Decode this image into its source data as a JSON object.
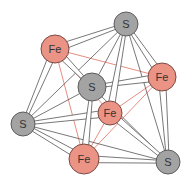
{
  "diagram": {
    "colors": {
      "fe_fill": "#eb9486",
      "fe_stroke": "#7a4a44",
      "s_fill": "#a3a3a3",
      "s_stroke": "#5c5c5c",
      "bond_stroke": "#555555",
      "bond_fill": "#ffffff",
      "fe_fe_line": "#e0705f",
      "s_s_line": "#555555",
      "label": "#333333"
    },
    "nodes": [
      {
        "id": "s1",
        "label": "S",
        "element": "S",
        "x": 126,
        "y": 24,
        "r": 12
      },
      {
        "id": "fe1",
        "label": "Fe",
        "element": "Fe",
        "x": 55,
        "y": 49,
        "r": 14
      },
      {
        "id": "s2",
        "label": "S",
        "element": "S",
        "x": 92,
        "y": 87,
        "r": 14
      },
      {
        "id": "fe2",
        "label": "Fe",
        "element": "Fe",
        "x": 162,
        "y": 77,
        "r": 14
      },
      {
        "id": "fe3",
        "label": "Fe",
        "element": "Fe",
        "x": 110,
        "y": 113,
        "r": 12
      },
      {
        "id": "s3",
        "label": "S",
        "element": "S",
        "x": 23,
        "y": 124,
        "r": 12
      },
      {
        "id": "fe4",
        "label": "Fe",
        "element": "Fe",
        "x": 84,
        "y": 159,
        "r": 15
      },
      {
        "id": "s4",
        "label": "S",
        "element": "S",
        "x": 168,
        "y": 162,
        "r": 12
      }
    ],
    "edges": [
      {
        "from": "fe1",
        "to": "s1",
        "type": "bond"
      },
      {
        "from": "fe1",
        "to": "s2",
        "type": "bond"
      },
      {
        "from": "fe1",
        "to": "s3",
        "type": "bond"
      },
      {
        "from": "fe2",
        "to": "s1",
        "type": "bond"
      },
      {
        "from": "fe2",
        "to": "s2",
        "type": "bond"
      },
      {
        "from": "fe2",
        "to": "s4",
        "type": "bond"
      },
      {
        "from": "fe3",
        "to": "s1",
        "type": "bond"
      },
      {
        "from": "fe3",
        "to": "s3",
        "type": "bond"
      },
      {
        "from": "fe3",
        "to": "s4",
        "type": "bond"
      },
      {
        "from": "fe4",
        "to": "s2",
        "type": "bond"
      },
      {
        "from": "fe4",
        "to": "s3",
        "type": "bond"
      },
      {
        "from": "fe4",
        "to": "s4",
        "type": "bond"
      },
      {
        "from": "s1",
        "to": "s2",
        "type": "ss"
      },
      {
        "from": "s1",
        "to": "s3",
        "type": "ss"
      },
      {
        "from": "s1",
        "to": "s4",
        "type": "ss"
      },
      {
        "from": "s2",
        "to": "s3",
        "type": "ss"
      },
      {
        "from": "s2",
        "to": "s4",
        "type": "ss"
      },
      {
        "from": "s3",
        "to": "s4",
        "type": "ss"
      },
      {
        "from": "fe1",
        "to": "fe2",
        "type": "fefe"
      },
      {
        "from": "fe1",
        "to": "fe3",
        "type": "fefe"
      },
      {
        "from": "fe1",
        "to": "fe4",
        "type": "fefe"
      },
      {
        "from": "fe2",
        "to": "fe3",
        "type": "fefe"
      },
      {
        "from": "fe2",
        "to": "fe4",
        "type": "fefe"
      },
      {
        "from": "fe3",
        "to": "fe4",
        "type": "fefe"
      }
    ]
  }
}
